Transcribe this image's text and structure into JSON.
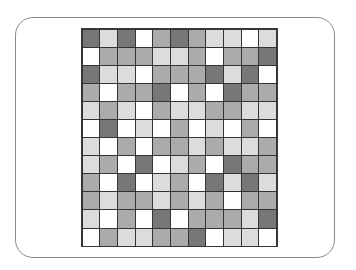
{
  "figure": {
    "columns": 11,
    "rows": 12,
    "shade_legend": {
      "D": "#777777",
      "M": "#ababab",
      "L": "#dcdcdc",
      "W": "#ffffff"
    },
    "cells": [
      [
        "D",
        "L",
        "D",
        "W",
        "M",
        "D",
        "M",
        "L",
        "L",
        "W",
        "L"
      ],
      [
        "W",
        "M",
        "M",
        "M",
        "L",
        "L",
        "M",
        "W",
        "M",
        "M",
        "D"
      ],
      [
        "D",
        "L",
        "L",
        "W",
        "M",
        "M",
        "M",
        "D",
        "L",
        "D",
        "W"
      ],
      [
        "M",
        "W",
        "M",
        "M",
        "D",
        "W",
        "M",
        "W",
        "D",
        "M",
        "M"
      ],
      [
        "L",
        "M",
        "L",
        "W",
        "M",
        "L",
        "L",
        "M",
        "M",
        "L",
        "L"
      ],
      [
        "W",
        "D",
        "W",
        "L",
        "W",
        "M",
        "W",
        "L",
        "W",
        "M",
        "W"
      ],
      [
        "L",
        "W",
        "M",
        "W",
        "M",
        "M",
        "L",
        "M",
        "L",
        "L",
        "M"
      ],
      [
        "L",
        "M",
        "W",
        "D",
        "W",
        "L",
        "M",
        "W",
        "D",
        "M",
        "M"
      ],
      [
        "M",
        "W",
        "D",
        "W",
        "L",
        "M",
        "W",
        "D",
        "L",
        "D",
        "L"
      ],
      [
        "M",
        "L",
        "M",
        "M",
        "L",
        "M",
        "L",
        "M",
        "W",
        "M",
        "M"
      ],
      [
        "L",
        "W",
        "M",
        "W",
        "D",
        "W",
        "M",
        "M",
        "M",
        "L",
        "D"
      ],
      [
        "W",
        "M",
        "L",
        "L",
        "M",
        "M",
        "D",
        "W",
        "L",
        "L",
        "W"
      ]
    ]
  }
}
